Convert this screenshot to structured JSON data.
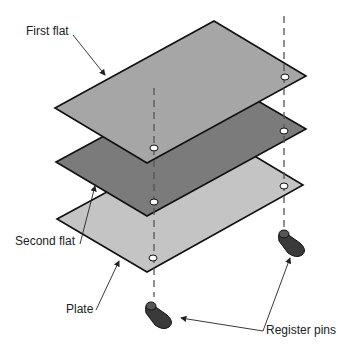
{
  "diagram": {
    "labels": {
      "first_flat": "First flat",
      "second_flat": "Second flat",
      "plate": "Plate",
      "register_pins": "Register pins"
    },
    "colors": {
      "first_flat": "#a6a6a6",
      "second_flat": "#7b7b7b",
      "plate": "#c4c4c4",
      "pins": "#3a3a3a",
      "outline": "#111111"
    }
  }
}
